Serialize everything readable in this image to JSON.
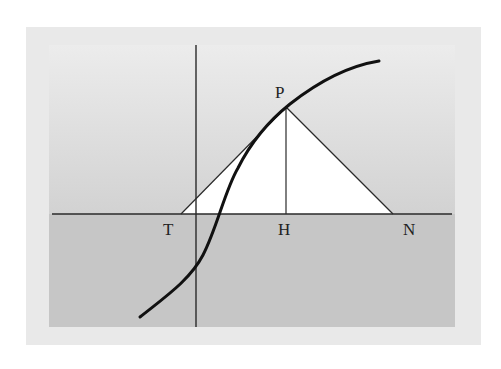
{
  "diagram": {
    "colors": {
      "outer_frame": "#e9e9e9",
      "upper_panel_top": "#ececec",
      "upper_panel_bottom": "#d2d2d2",
      "lower_panel": "#c6c6c6",
      "triangle_fill": "#ffffff",
      "line": "#2a2a2a",
      "curve": "#111111"
    },
    "axes": {
      "x_axis": {
        "x1": 52,
        "y1": 214,
        "x2": 452,
        "y2": 214
      },
      "y_axis": {
        "x1": 196,
        "y1": 45,
        "x2": 196,
        "y2": 327
      }
    },
    "points": {
      "P": {
        "label": "P",
        "x": 286,
        "y": 107,
        "label_x": 275,
        "label_y": 98
      },
      "T": {
        "label": "T",
        "x": 181,
        "y": 214,
        "label_x": 163,
        "label_y": 235
      },
      "H": {
        "label": "H",
        "x": 286,
        "y": 214,
        "label_x": 278,
        "label_y": 235
      },
      "N": {
        "label": "N",
        "x": 393,
        "y": 214,
        "label_x": 403,
        "label_y": 235
      }
    },
    "segments": [
      {
        "name": "tangent-line-TP",
        "from": "T",
        "to": "P"
      },
      {
        "name": "perpendicular-PH",
        "from": "P",
        "to": "H"
      },
      {
        "name": "normal-line-PN",
        "from": "P",
        "to": "N"
      }
    ],
    "curve": {
      "name": "s-curve",
      "path": "M140,317 C165,297 190,280 203,255 C217,228 225,190 238,168 C252,140 270,120 290,104 C318,82 348,66 379,61"
    },
    "labels": [
      "P",
      "T",
      "H",
      "N"
    ]
  }
}
